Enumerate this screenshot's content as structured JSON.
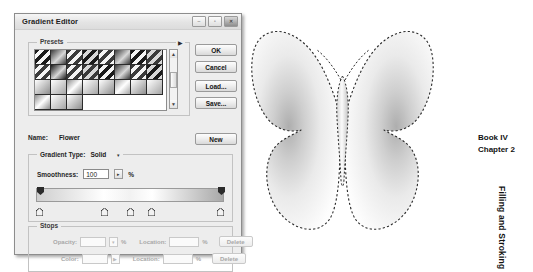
{
  "dialog": {
    "title": "Gradient Editor",
    "window_buttons": [
      {
        "name": "minimize",
        "glyph": "–"
      },
      {
        "name": "maximize",
        "glyph": "▫"
      },
      {
        "name": "close",
        "glyph": "✕"
      }
    ],
    "presets": {
      "label": "Presets",
      "menu_arrow": "▶",
      "scroll_up": "▲",
      "scroll_down": "▼",
      "swatch_count": 32
    },
    "buttons": {
      "ok": "OK",
      "cancel": "Cancel",
      "load": "Load...",
      "save": "Save...",
      "new": "New"
    },
    "name_row": {
      "label": "Name:",
      "value": "Flower"
    },
    "gradient_settings": {
      "type_label": "Gradient Type:",
      "type_value": "Solid",
      "type_caret": "▾",
      "smoothness_label": "Smoothness:",
      "smoothness_value": "100",
      "smoothness_caret": "▸",
      "percent": "%"
    },
    "gradient_bar": {
      "opacity_stops": [
        0,
        100
      ],
      "color_stops": [
        0,
        36,
        50,
        62,
        100
      ],
      "colors": [
        "#cfcfcf",
        "#ffffff",
        "#f2f2f2",
        "#ffffff",
        "#a8a8a8"
      ]
    },
    "stops": {
      "label": "Stops",
      "opacity_label": "Opacity:",
      "opacity_value": "",
      "opacity_caret": "▾",
      "opacity_percent": "%",
      "opacity_location_label": "Location:",
      "opacity_location_value": "",
      "opacity_location_percent": "%",
      "opacity_delete": "Delete",
      "color_label": "Color:",
      "color_caret": "▶",
      "color_location_label": "Location:",
      "color_location_value": "",
      "color_location_percent": "%",
      "color_delete": "Delete"
    }
  },
  "canvas": {
    "shape_name": "butterfly",
    "fill_description": "gradient-filled butterfly with marching-ants selection outline"
  },
  "margin": {
    "book": "Book IV",
    "chapter": "Chapter 2",
    "running_head": "Filling and Stroking"
  },
  "colors": {
    "dialog_face": "#ededed",
    "dialog_border": "#8d8d8d",
    "text": "#141414",
    "disabled_text": "#a8a8a8"
  }
}
